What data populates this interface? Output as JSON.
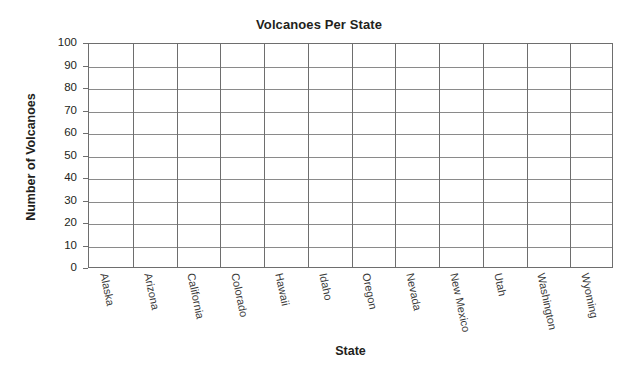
{
  "chart_data": {
    "type": "bar",
    "title": "Volcanoes Per State",
    "xlabel": "State",
    "ylabel": "Number of Volcanoes",
    "categories": [
      "Alaska",
      "Arizona",
      "California",
      "Colorado",
      "Hawaii",
      "Idaho",
      "Oregon",
      "Nevada",
      "New Mexico",
      "Utah",
      "Washington",
      "Wyoming"
    ],
    "values": [
      null,
      null,
      null,
      null,
      null,
      null,
      null,
      null,
      null,
      null,
      null,
      null
    ],
    "ylim": [
      0,
      100
    ],
    "ytick_labels": [
      "100",
      "90",
      "80",
      "70",
      "60",
      "50",
      "40",
      "30",
      "20",
      "10",
      "0"
    ],
    "ytick_values": [
      100,
      90,
      80,
      70,
      60,
      50,
      40,
      30,
      20,
      10,
      0
    ],
    "ytick_step": 10,
    "grid": true,
    "grid_horizontal": true,
    "grid_vertical": true,
    "legend": false,
    "legend_position": "none",
    "note": "Blank grid template — no bars plotted",
    "colors": {
      "text": "#231f20",
      "axis": "#6e6e6e",
      "gridline": "#8a8a8a",
      "background": "#ffffff",
      "tick_label": "#3a3a3a"
    }
  }
}
